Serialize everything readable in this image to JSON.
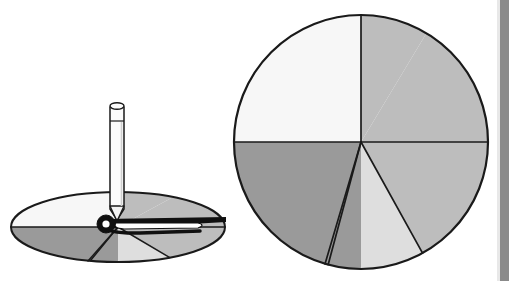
{
  "figure": {
    "background_color": "#ffffff",
    "stroke_color": "#1a1a1a",
    "width": 509,
    "height": 281
  },
  "palette": {
    "medium_gray": "#bdbdbd",
    "light_gray": "#dedede",
    "near_white": "#f7f7f7",
    "dark_gray": "#9a9a9a",
    "outline": "#1a1a1a",
    "pencil_body": "#fbfbfb",
    "pencil_tip": "#f2f2f2",
    "needle_black": "#101010",
    "edge_bar": "#8a8a8a"
  },
  "chart_data": {
    "type": "pie",
    "center": {
      "x": 361,
      "y": 142
    },
    "radius": 127,
    "grid": false,
    "legend": "none",
    "categories": [
      "sector-top-left",
      "sector-top-right-narrow",
      "sector-right-upper",
      "sector-right-lower",
      "sector-bottom-dark",
      "sector-left-lower"
    ],
    "values": [
      25,
      8.6,
      16.4,
      25,
      17,
      8
    ],
    "angles_deg": [
      90,
      31,
      59,
      90,
      61,
      29
    ],
    "colors": [
      "#bdbdbd",
      "#bdbdbd",
      "#bdbdbd",
      "#dedede",
      "#9a9a9a",
      "#f7f7f7"
    ],
    "sector_boundaries_deg_from_12oclock_clockwise": [
      0,
      31,
      90,
      151,
      180,
      270,
      360
    ],
    "xlabel": "",
    "ylabel": ""
  },
  "spinner_disc": {
    "label": "Perspective view of the same disc with a pencil pivot and a black arrow needle",
    "center": {
      "x": 118,
      "y": 227
    },
    "radius_x": 107,
    "radius_y": 35,
    "sector_colors": [
      "#bdbdbd",
      "#bdbdbd",
      "#bdbdbd",
      "#dedede",
      "#9a9a9a",
      "#f7f7f7"
    ]
  },
  "pencil": {
    "label": "pencil held upright as the spinner pivot",
    "x": 110,
    "top_y": 103,
    "bottom_y": 218,
    "width": 14,
    "body_color": "#fbfbfb",
    "tip_color": "#f2f2f2"
  },
  "needle": {
    "label": "black spinner arrow pointing right",
    "hub": {
      "x": 106,
      "y": 224
    },
    "tip": {
      "x": 226,
      "y": 220
    },
    "color": "#101010"
  },
  "decor": {
    "right_edge_bar": "page edge shadow strip",
    "right_edge_light": "page edge highlight strip"
  }
}
